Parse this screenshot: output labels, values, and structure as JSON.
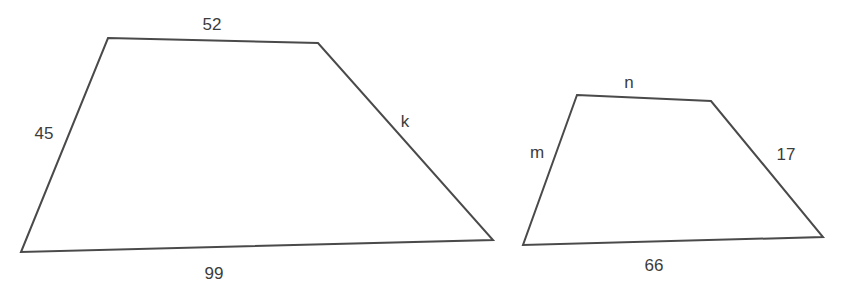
{
  "figure": {
    "background": "#ffffff",
    "stroke_color": "#4a4a4a",
    "label_color": "#3c3c3c"
  },
  "trapezoids": [
    {
      "id": "large",
      "vertices": [
        [
          108,
          38
        ],
        [
          318,
          43
        ],
        [
          493,
          240
        ],
        [
          21,
          252
        ]
      ],
      "labels": {
        "top": "52",
        "left": "45",
        "right": "k",
        "bottom": "99"
      }
    },
    {
      "id": "small",
      "vertices": [
        [
          577,
          95
        ],
        [
          711,
          101
        ],
        [
          823,
          237
        ],
        [
          523,
          245
        ]
      ],
      "labels": {
        "top": "n",
        "left": "m",
        "right": "17",
        "bottom": "66"
      }
    }
  ]
}
